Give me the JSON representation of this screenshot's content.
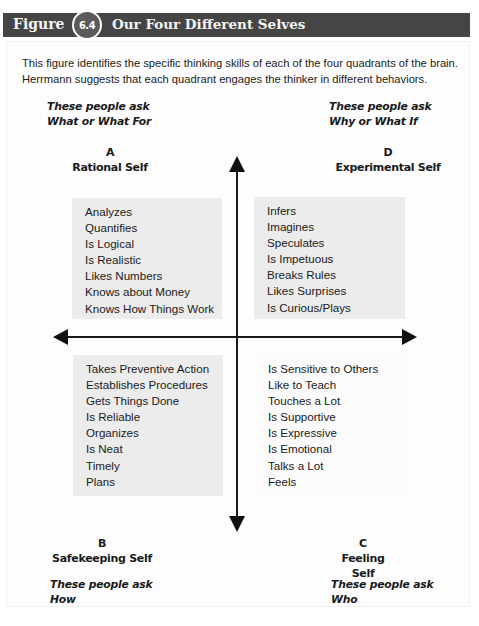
{
  "header": {
    "figure_label": "Figure",
    "figure_number": "6.4",
    "title": "Our Four Different Selves"
  },
  "intro": {
    "line1": "This figure identifies the specific thinking skills of each of the four quadrants of the brain.",
    "line2": "Herrmann suggests that each quadrant engages the thinker in different behaviors."
  },
  "quadrants": {
    "a": {
      "letter": "A",
      "name": "Rational Self",
      "ask_prefix": "These people ask",
      "ask_question": "What or What For",
      "traits": [
        "Analyzes",
        "Quantifies",
        "Is Logical",
        "Is Realistic",
        "Likes Numbers",
        "Knows about Money",
        "Knows How Things Work"
      ]
    },
    "d": {
      "letter": "D",
      "name": "Experimental Self",
      "ask_prefix": "These people ask",
      "ask_question": "Why or What If",
      "traits": [
        "Infers",
        "Imagines",
        "Speculates",
        "Is Impetuous",
        "Breaks Rules",
        "Likes Surprises",
        "Is Curious/Plays"
      ]
    },
    "b": {
      "letter": "B",
      "name": "Safekeeping Self",
      "ask_prefix": "These people ask",
      "ask_question": "How",
      "traits": [
        "Takes Preventive Action",
        "Establishes Procedures",
        "Gets Things Done",
        "Is Reliable",
        "Organizes",
        "Is Neat",
        "Timely",
        "Plans"
      ]
    },
    "c": {
      "letter": "C",
      "name": "Feeling Self",
      "ask_prefix": "These people ask",
      "ask_question": "Who",
      "traits": [
        "Is Sensitive to Others",
        "Like to Teach",
        "Touches a Lot",
        "Is Supportive",
        "Is Expressive",
        "Is Emotional",
        "Talks a Lot",
        "Feels"
      ]
    }
  },
  "colors": {
    "header_bar": "#454545",
    "badge": "#5a5a5a",
    "box_shaded": "#ececec",
    "axis": "#1a1a1a"
  }
}
